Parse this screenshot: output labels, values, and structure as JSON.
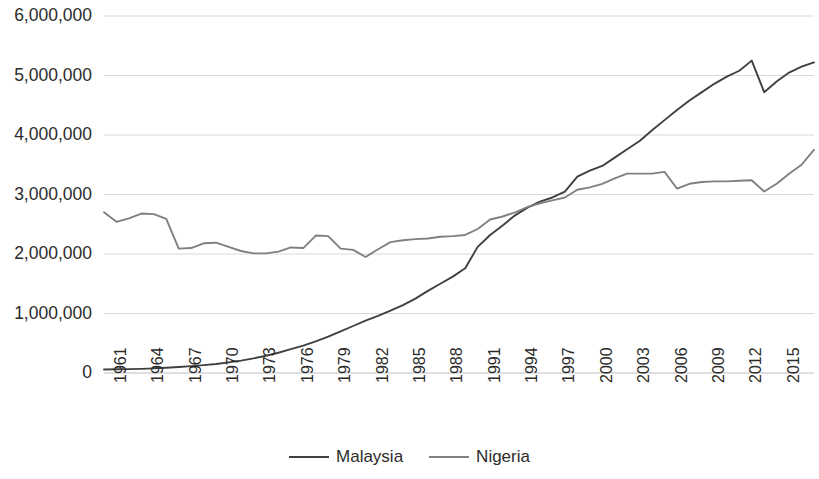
{
  "chart_data": {
    "type": "line",
    "title": "",
    "xlabel": "",
    "ylabel": "",
    "ylim": [
      0,
      6000000
    ],
    "xlim": [
      1961,
      2018
    ],
    "grid": true,
    "legend_position": "bottom",
    "ytick_labels": [
      "6,000,000",
      "5,000,000",
      "4,000,000",
      "3,000,000",
      "2,000,000",
      "1,000,000",
      "0"
    ],
    "ytick_values": [
      6000000,
      5000000,
      4000000,
      3000000,
      2000000,
      1000000,
      0
    ],
    "xtick_labels": [
      "1961",
      "1964",
      "1967",
      "1970",
      "1973",
      "1976",
      "1979",
      "1982",
      "1985",
      "1988",
      "1991",
      "1994",
      "1997",
      "2000",
      "2003",
      "2006",
      "2009",
      "2012",
      "2015",
      "2018"
    ],
    "x": [
      1961,
      1962,
      1963,
      1964,
      1965,
      1966,
      1967,
      1968,
      1969,
      1970,
      1971,
      1972,
      1973,
      1974,
      1975,
      1976,
      1977,
      1978,
      1979,
      1980,
      1981,
      1982,
      1983,
      1984,
      1985,
      1986,
      1987,
      1988,
      1989,
      1990,
      1991,
      1992,
      1993,
      1994,
      1995,
      1996,
      1997,
      1998,
      1999,
      2000,
      2001,
      2002,
      2003,
      2004,
      2005,
      2006,
      2007,
      2008,
      2009,
      2010,
      2011,
      2012,
      2013,
      2014,
      2015,
      2016,
      2017,
      2018
    ],
    "series": [
      {
        "name": "Malaysia",
        "color": "#404040",
        "values": [
          60000,
          62000,
          65000,
          70000,
          78000,
          88000,
          100000,
          115000,
          132000,
          152000,
          178000,
          208000,
          245000,
          290000,
          340000,
          400000,
          460000,
          530000,
          610000,
          700000,
          790000,
          880000,
          960000,
          1050000,
          1140000,
          1250000,
          1380000,
          1500000,
          1620000,
          1760000,
          2120000,
          2320000,
          2480000,
          2650000,
          2780000,
          2880000,
          2950000,
          3050000,
          3300000,
          3400000,
          3480000,
          3620000,
          3760000,
          3900000,
          4080000,
          4250000,
          4420000,
          4580000,
          4720000,
          4860000,
          4980000,
          5080000,
          5250000,
          4720000,
          4900000,
          5050000,
          5150000,
          5220000
        ]
      },
      {
        "name": "Nigeria",
        "color": "#808080",
        "values": [
          2700000,
          2540000,
          2600000,
          2680000,
          2670000,
          2590000,
          2090000,
          2100000,
          2180000,
          2190000,
          2120000,
          2050000,
          2010000,
          2010000,
          2040000,
          2110000,
          2100000,
          2310000,
          2300000,
          2090000,
          2070000,
          1950000,
          2080000,
          2200000,
          2230000,
          2250000,
          2260000,
          2290000,
          2300000,
          2320000,
          2420000,
          2580000,
          2630000,
          2700000,
          2790000,
          2850000,
          2900000,
          2950000,
          3080000,
          3120000,
          3180000,
          3270000,
          3350000,
          3350000,
          3350000,
          3380000,
          3100000,
          3180000,
          3210000,
          3220000,
          3220000,
          3230000,
          3240000,
          3050000,
          3180000,
          3350000,
          3500000,
          3750000
        ]
      }
    ]
  },
  "legend": {
    "entries": [
      {
        "label": "Malaysia",
        "color": "#404040"
      },
      {
        "label": "Nigeria",
        "color": "#808080"
      }
    ]
  },
  "geometry": {
    "plot_left": 104,
    "plot_right": 814,
    "plot_top": 16,
    "plot_bottom": 373,
    "gridline_color": "#d9d9d9",
    "axis_color": "#bfbfbf"
  }
}
